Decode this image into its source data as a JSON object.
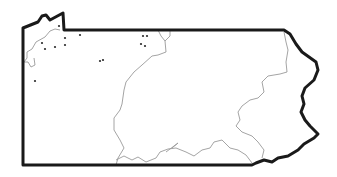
{
  "map": {
    "subject": "Pennsylvania state outline",
    "colors": {
      "background": "#ffffff",
      "border": "#1a1a1a",
      "rivers": "#9a9a9a",
      "points": "#2a2a2a"
    },
    "features": {
      "state_border": "M23,165 L23,28 L38,22 L42,16 L46,15 L50,20 L63,13 L64,30 L284,30 L290,34 L296,44 L302,52 L316,62 L318,70 L314,80 L305,88 L302,96 L304,104 L301,112 L305,120 L310,126 L318,134 L314,138 L304,144 L298,150 L288,156 L278,158 L272,162 L264,160 L256,163 L252,165 Z",
      "rivers": [
        "M24,62 L27,58 L27,52 L32,49 L36,42 L45,37 L50,31 L55,29 L60,30",
        "M24,62 L28,62 L31,67 L35,65 L34,58",
        "M158,30 L161,36 L165,41 L170,36 L170,30",
        "M165,41 L166,52 L158,55 L152,56 L142,65 L134,72 L126,82 L124,90 L122,104 L120,110 L114,118 L114,130 L120,140 L124,148 L118,158 L116,165",
        "M116,160 L124,156 L132,160 L138,157 L146,162 L156,158 L160,152 L168,149 L176,148 L186,152 L194,156 L202,150 L210,148 L214,142 L222,140 L230,148 L238,150 L246,155 L252,163",
        "M166,152 L174,146 L178,143 L172,148",
        "M284,32 L286,42 L288,50 L286,62 L287,72 L280,74 L268,76 L262,82 L264,92 L258,98 L250,100 L242,106 L238,112 L240,120 L236,126 L242,132 L252,136 L258,142 L264,150 L262,158"
      ],
      "points": [
        {
          "x": 42,
          "y": 43
        },
        {
          "x": 45,
          "y": 49
        },
        {
          "x": 55,
          "y": 47
        },
        {
          "x": 65,
          "y": 45
        },
        {
          "x": 65,
          "y": 38
        },
        {
          "x": 59,
          "y": 26
        },
        {
          "x": 80,
          "y": 35
        },
        {
          "x": 100,
          "y": 61
        },
        {
          "x": 103,
          "y": 60
        },
        {
          "x": 143,
          "y": 36
        },
        {
          "x": 147,
          "y": 36
        },
        {
          "x": 141,
          "y": 44
        },
        {
          "x": 145,
          "y": 46
        },
        {
          "x": 35,
          "y": 81
        }
      ]
    }
  }
}
